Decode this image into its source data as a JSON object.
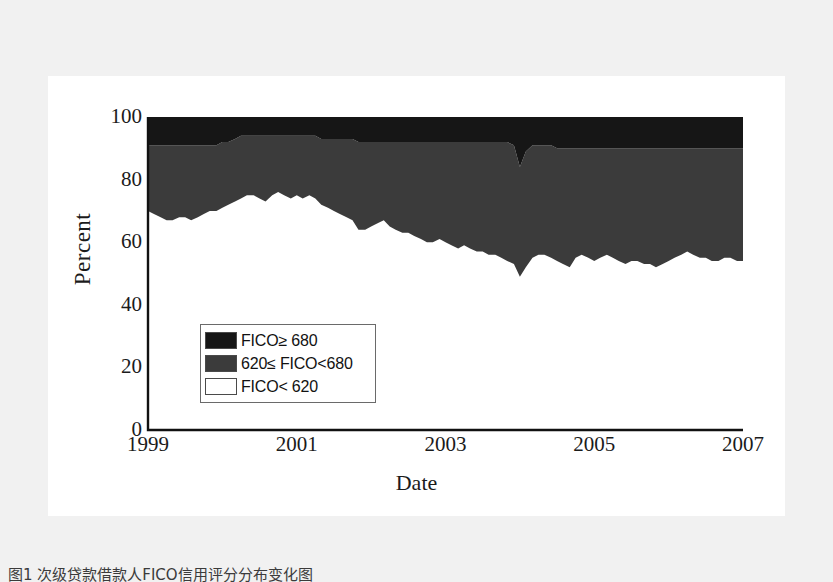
{
  "figure": {
    "caption": "图1 次级贷款借款人FICO信用评分分布变化图",
    "background_color": "#f1f1f1",
    "panel_color": "#ffffff"
  },
  "legend": {
    "position": "inside-lower-left",
    "entries": [
      {
        "label": "FICO≥ 680",
        "color": "#161616",
        "swatch": "black-swatch"
      },
      {
        "label": "620≤ FICO<680",
        "color": "#3b3b3b",
        "swatch": "dark-gray-swatch"
      },
      {
        "label": "FICO< 620",
        "color": "#ffffff",
        "swatch": "white-swatch"
      }
    ]
  },
  "chart_data": {
    "type": "area",
    "stacked": true,
    "title": "",
    "xlabel": "Date",
    "ylabel": "Percent",
    "xlim": [
      1999,
      2007
    ],
    "ylim": [
      0,
      100
    ],
    "grid": false,
    "xticks": [
      "1999",
      "2001",
      "2003",
      "2005",
      "2007"
    ],
    "xtick_values": [
      1999,
      2001,
      2003,
      2005,
      2007
    ],
    "yticks": [
      "0",
      "20",
      "40",
      "60",
      "80",
      "100"
    ],
    "ytick_values": [
      0,
      20,
      40,
      60,
      80,
      100
    ],
    "x": [
      1999.0,
      1999.08,
      1999.17,
      1999.25,
      1999.33,
      1999.42,
      1999.5,
      1999.58,
      1999.67,
      1999.75,
      1999.83,
      1999.92,
      2000.0,
      2000.08,
      2000.17,
      2000.25,
      2000.33,
      2000.42,
      2000.5,
      2000.58,
      2000.67,
      2000.75,
      2000.83,
      2000.92,
      2001.0,
      2001.08,
      2001.17,
      2001.25,
      2001.33,
      2001.42,
      2001.5,
      2001.58,
      2001.67,
      2001.75,
      2001.83,
      2001.92,
      2002.0,
      2002.08,
      2002.17,
      2002.25,
      2002.33,
      2002.42,
      2002.5,
      2002.58,
      2002.67,
      2002.75,
      2002.83,
      2002.92,
      2003.0,
      2003.08,
      2003.17,
      2003.25,
      2003.33,
      2003.42,
      2003.5,
      2003.58,
      2003.67,
      2003.75,
      2003.83,
      2003.92,
      2004.0,
      2004.08,
      2004.17,
      2004.25,
      2004.33,
      2004.42,
      2004.5,
      2004.58,
      2004.67,
      2004.75,
      2004.83,
      2004.92,
      2005.0,
      2005.08,
      2005.17,
      2005.25,
      2005.33,
      2005.42,
      2005.5,
      2005.58,
      2005.67,
      2005.75,
      2005.83,
      2005.92,
      2006.0,
      2006.08,
      2006.17,
      2006.25,
      2006.33,
      2006.42,
      2006.5,
      2006.58,
      2006.67,
      2006.75,
      2006.83,
      2006.92,
      2007.0
    ],
    "series": [
      {
        "name": "FICO< 620",
        "color": "#ffffff",
        "values": [
          70,
          69,
          68,
          67,
          67,
          68,
          68,
          67,
          68,
          69,
          70,
          70,
          71,
          72,
          73,
          74,
          75,
          75,
          74,
          73,
          75,
          76,
          75,
          74,
          75,
          74,
          75,
          74,
          72,
          71,
          70,
          69,
          68,
          67,
          64,
          64,
          65,
          66,
          67,
          65,
          64,
          63,
          63,
          62,
          61,
          60,
          60,
          61,
          60,
          59,
          58,
          59,
          58,
          57,
          57,
          56,
          56,
          55,
          54,
          53,
          49,
          52,
          55,
          56,
          56,
          55,
          54,
          53,
          52,
          55,
          56,
          55,
          54,
          55,
          56,
          55,
          54,
          53,
          54,
          54,
          53,
          53,
          52,
          53,
          54,
          55,
          56,
          57,
          56,
          55,
          55,
          54,
          54,
          55,
          55,
          54,
          54
        ]
      },
      {
        "name": "620≤ FICO<680",
        "color": "#3b3b3b",
        "values": [
          21,
          22,
          23,
          24,
          24,
          23,
          23,
          24,
          23,
          22,
          21,
          21,
          21,
          20,
          20,
          20,
          19,
          19,
          20,
          21,
          19,
          18,
          19,
          20,
          19,
          20,
          19,
          20,
          21,
          22,
          23,
          24,
          25,
          26,
          28,
          28,
          27,
          26,
          25,
          27,
          28,
          29,
          29,
          30,
          31,
          32,
          32,
          31,
          32,
          33,
          34,
          33,
          34,
          35,
          35,
          36,
          36,
          37,
          38,
          38,
          35,
          37,
          36,
          35,
          35,
          36,
          36,
          37,
          38,
          35,
          34,
          35,
          36,
          35,
          34,
          35,
          36,
          37,
          36,
          36,
          37,
          37,
          38,
          37,
          36,
          35,
          34,
          33,
          34,
          35,
          35,
          36,
          36,
          35,
          35,
          36,
          36
        ]
      },
      {
        "name": "FICO≥ 680",
        "color": "#161616",
        "values": [
          9,
          9,
          9,
          9,
          9,
          9,
          9,
          9,
          9,
          9,
          9,
          9,
          8,
          8,
          7,
          6,
          6,
          6,
          6,
          6,
          6,
          6,
          6,
          6,
          6,
          6,
          6,
          6,
          7,
          7,
          7,
          7,
          7,
          7,
          8,
          8,
          8,
          8,
          8,
          8,
          8,
          8,
          8,
          8,
          8,
          8,
          8,
          8,
          8,
          8,
          8,
          8,
          8,
          8,
          8,
          8,
          8,
          8,
          8,
          9,
          16,
          11,
          9,
          9,
          9,
          9,
          10,
          10,
          10,
          10,
          10,
          10,
          10,
          10,
          10,
          10,
          10,
          10,
          10,
          10,
          10,
          10,
          10,
          10,
          10,
          10,
          10,
          10,
          10,
          10,
          10,
          10,
          10,
          10,
          10,
          10,
          10
        ]
      }
    ]
  }
}
